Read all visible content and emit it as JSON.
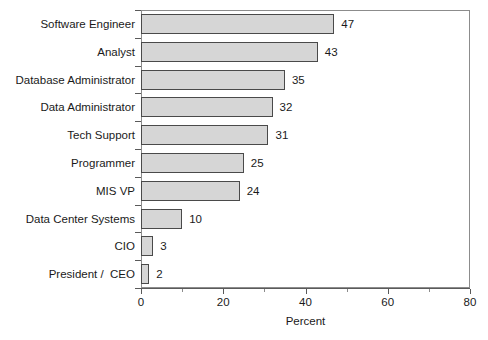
{
  "chart_data": {
    "type": "bar",
    "orientation": "horizontal",
    "title": "",
    "xlabel": "Percent",
    "ylabel": "",
    "xlim": [
      0,
      80
    ],
    "xticks": [
      0,
      20,
      40,
      60,
      80
    ],
    "xtick_labels": [
      "0",
      "20",
      "40",
      "60",
      "80"
    ],
    "grid": false,
    "legend": null,
    "categories": [
      "Software Engineer",
      "Analyst",
      "Database Administrator",
      "Data Administrator",
      "Tech Support",
      "Programmer",
      "MIS VP",
      "Data Center Systems",
      "CIO",
      "President /  CEO"
    ],
    "values": [
      47,
      43,
      35,
      32,
      31,
      25,
      24,
      10,
      3,
      2
    ],
    "value_labels": [
      "47",
      "43",
      "35",
      "32",
      "31",
      "25",
      "24",
      "10",
      "3",
      "2"
    ],
    "bar_color": "#d6d6d6",
    "bar_border_color": "#4a4a4a",
    "axis_color": "#5a5a5a",
    "frame_color": "#8c8c8c",
    "text_color": "#1a1a1a"
  },
  "footer": {
    "artifact_text": ""
  }
}
